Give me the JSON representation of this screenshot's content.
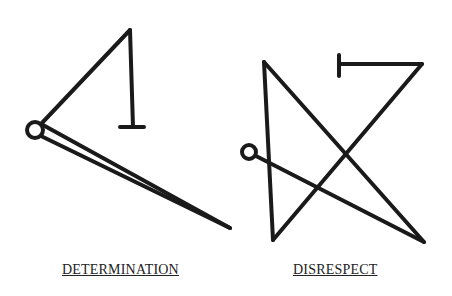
{
  "sigils": [
    {
      "name": "determination",
      "label": "DETERMINATION"
    },
    {
      "name": "disrespect",
      "label": "DISRESPECT"
    }
  ],
  "colors": {
    "stroke": "#1a1a1a",
    "background": "#ffffff"
  }
}
